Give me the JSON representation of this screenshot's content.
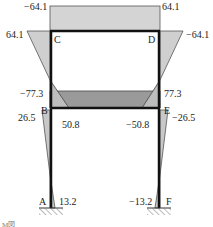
{
  "diagram": {
    "type": "bending-moment-diagram",
    "colors": {
      "frame": "#111111",
      "moment_light": "#d4d4d4",
      "moment_dark": "#9a9a9a",
      "outline": "#555555",
      "hatch": "#777777"
    },
    "nodes": {
      "A": "A",
      "B": "B",
      "C": "C",
      "D": "D",
      "E": "E",
      "F": "F"
    },
    "values": {
      "top_beam_left": "−64.1",
      "top_beam_right": "64.1",
      "col_C_top": "64.1",
      "col_D_top": "−64.1",
      "col_B_upper": "−77.3",
      "col_E_upper": "77.3",
      "col_B_lower": "26.5",
      "col_E_lower": "−26.5",
      "beam_B": "50.8",
      "beam_E": "−50.8",
      "col_A_base": "13.2",
      "col_F_base": "−13.2"
    },
    "caption": "M図"
  }
}
